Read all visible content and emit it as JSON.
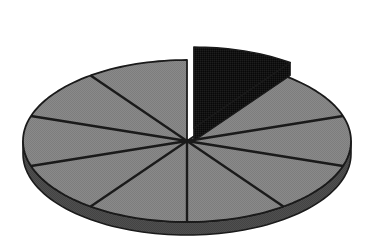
{
  "figure": {
    "width": 373,
    "height": 250,
    "background": "#ffffff",
    "title": "",
    "caption": ""
  },
  "chart_data": {
    "type": "pie",
    "title": "",
    "subtitle": "",
    "xlabel": "",
    "ylabel": "",
    "legend": [],
    "legend_position": "none",
    "grid": false,
    "style": "3d-exploded-pie",
    "slice_count": 10,
    "categories": [
      "Slice 1",
      "Slice 2",
      "Slice 3",
      "Slice 4",
      "Slice 5",
      "Slice 6",
      "Slice 7",
      "Slice 8",
      "Slice 9",
      "Slice 10"
    ],
    "values": [
      10,
      10,
      10,
      10,
      10,
      10,
      10,
      10,
      10,
      10
    ],
    "percentages": [
      10,
      10,
      10,
      10,
      10,
      10,
      10,
      10,
      10,
      10
    ],
    "slice_angle_degrees": 36,
    "labels_shown": false,
    "exploded_index": 0,
    "exploded_label": "Slice 1",
    "slices": [
      {
        "label": "Slice 1",
        "value": 10,
        "percent": 10,
        "start_angle": -90,
        "end_angle": -54,
        "color": "#111111",
        "exploded": true,
        "offset": 22
      },
      {
        "label": "Slice 2",
        "value": 10,
        "percent": 10,
        "start_angle": -54,
        "end_angle": -18,
        "color": "#878787",
        "exploded": false,
        "offset": 0
      },
      {
        "label": "Slice 3",
        "value": 10,
        "percent": 10,
        "start_angle": -18,
        "end_angle": 18,
        "color": "#878787",
        "exploded": false,
        "offset": 0
      },
      {
        "label": "Slice 4",
        "value": 10,
        "percent": 10,
        "start_angle": 18,
        "end_angle": 54,
        "color": "#878787",
        "exploded": false,
        "offset": 0
      },
      {
        "label": "Slice 5",
        "value": 10,
        "percent": 10,
        "start_angle": 54,
        "end_angle": 90,
        "color": "#878787",
        "exploded": false,
        "offset": 0
      },
      {
        "label": "Slice 6",
        "value": 10,
        "percent": 10,
        "start_angle": 90,
        "end_angle": 126,
        "color": "#878787",
        "exploded": false,
        "offset": 0
      },
      {
        "label": "Slice 7",
        "value": 10,
        "percent": 10,
        "start_angle": 126,
        "end_angle": 162,
        "color": "#878787",
        "exploded": false,
        "offset": 0
      },
      {
        "label": "Slice 8",
        "value": 10,
        "percent": 10,
        "start_angle": 162,
        "end_angle": 198,
        "color": "#878787",
        "exploded": false,
        "offset": 0
      },
      {
        "label": "Slice 9",
        "value": 10,
        "percent": 10,
        "start_angle": 198,
        "end_angle": 234,
        "color": "#878787",
        "exploded": false,
        "offset": 0
      },
      {
        "label": "Slice 10",
        "value": 10,
        "percent": 10,
        "start_angle": 234,
        "end_angle": 270,
        "color": "#878787",
        "exploded": false,
        "offset": 0
      }
    ],
    "colors": {
      "slice_fill": "#878787",
      "slice_fill_highlight": "#111111",
      "side_wall": "#4c4c4c",
      "side_wall_highlight": "#0a0a0a",
      "outline": "#1a1a1a",
      "divider": "#1a1a1a",
      "background": "#ffffff"
    },
    "geometry": {
      "center_x": 187,
      "center_y": 141,
      "radius_x": 164,
      "radius_y": 81,
      "depth": 13,
      "explode_direction_degrees": -72,
      "explode_distance": 22
    }
  }
}
